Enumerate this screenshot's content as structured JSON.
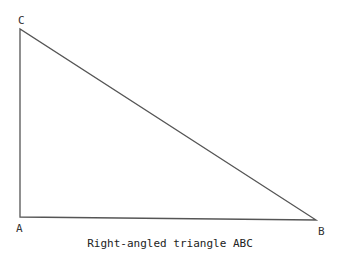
{
  "diagram": {
    "caption": "Right-angled triangle ABC",
    "vertices": {
      "A": {
        "label": "A"
      },
      "B": {
        "label": "B"
      },
      "C": {
        "label": "C"
      }
    },
    "line_color": "#555555"
  }
}
